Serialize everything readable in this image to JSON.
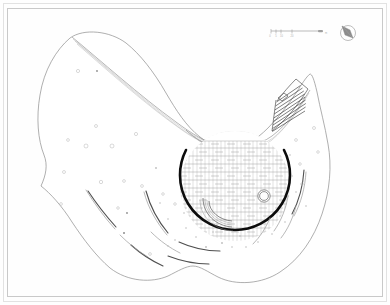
{
  "document": {
    "type": "architectural-site-plan",
    "title": "Site Plan",
    "sheet_background": "#fefefe",
    "frame_color": "#c9c9c9"
  },
  "legend": {
    "scale_bar": {
      "name": "graphic-scale-bar",
      "ticks": [
        "0",
        "5",
        "10",
        "20"
      ],
      "unit_label": "m"
    },
    "north_arrow": {
      "name": "north-arrow",
      "label": "N"
    }
  },
  "plan": {
    "site_boundary": {
      "label": "site-boundary",
      "stroke": "#8d8d8d"
    },
    "plaza": {
      "label": "circular-plaza",
      "ring_stroke": "#0c0c0c",
      "paving": "grid-pattern",
      "center_x": 235,
      "center_y": 186,
      "radius": 56
    },
    "fountain": {
      "label": "fountain",
      "center_x": 264,
      "center_y": 196,
      "radius": 6
    },
    "amphitheatre_steps": {
      "label": "amphitheatre-steps",
      "step_count": 9
    },
    "benches": {
      "label": "curved-benches",
      "count": 3
    },
    "landscape_paths": {
      "label": "landscape-path-arcs",
      "count": 12
    },
    "tree_markers": {
      "label": "tree-and-furniture-markers",
      "count": 34
    }
  },
  "colors": {
    "ink": "#0c0c0c",
    "mid_gray": "#8d8d8d",
    "light_gray": "#c9c9c9",
    "paper": "#fefefe"
  }
}
